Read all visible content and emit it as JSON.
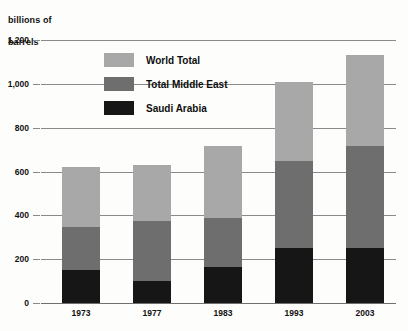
{
  "chart_data": {
    "type": "bar",
    "stacked": true,
    "title": "",
    "subtitle": "",
    "xlabel": "",
    "ylabel": "billions of barrels",
    "categories": [
      "1973",
      "1977",
      "1983",
      "1993",
      "2003"
    ],
    "ylim": [
      0,
      1200
    ],
    "ytick_labels": [
      "1,200",
      "1,000",
      "800",
      "600",
      "400",
      "200",
      "0"
    ],
    "ytick_values": [
      1200,
      1000,
      800,
      600,
      400,
      200,
      0
    ],
    "grid": true,
    "legend_position": "inside-top-left",
    "series": [
      {
        "name": "World Total",
        "color": "#a8a8a8",
        "values": [
          620,
          630,
          715,
          1010,
          1130
        ]
      },
      {
        "name": "Total Middle East",
        "color": "#6e6e6e",
        "values": [
          345,
          375,
          390,
          650,
          715
        ]
      },
      {
        "name": "Saudi Arabia",
        "color": "#161616",
        "values": [
          150,
          100,
          165,
          250,
          250
        ]
      }
    ]
  },
  "axis": {
    "y_title_line1": "billions of",
    "y_title_line2": "barrels"
  },
  "legend": {
    "items": [
      {
        "label": "World Total",
        "color": "#a8a8a8"
      },
      {
        "label": "Total Middle East",
        "color": "#6e6e6e"
      },
      {
        "label": "Saudi Arabia",
        "color": "#161616"
      }
    ]
  },
  "colors": {
    "world_total": "#a8a8a8",
    "total_middle_east": "#6e6e6e",
    "saudi_arabia": "#161616",
    "gridline": "#8a8a8a",
    "text": "#111111",
    "background": "#fdfdfb"
  }
}
